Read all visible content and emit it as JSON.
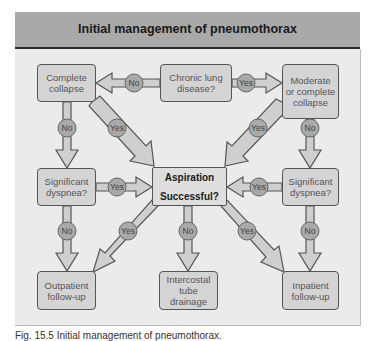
{
  "title": "Initial management of pneumothorax",
  "colors": {
    "title_bar": "#a9a9a9",
    "panel_bg": "#ebebeb",
    "node_fill": "#d4d4d4",
    "arrow_fill": "#cfcfcf",
    "badge_fill": "#aaaaaa",
    "stroke": "#555555"
  },
  "nodes": {
    "chronic_lung_disease": "Chronic lung\ndisease?",
    "complete_collapse": "Complete\ncollapse",
    "moderate_or_complete_collapse": "Moderate\nor complete\ncollapse",
    "significant_dyspnea_left": "Significant\ndyspnea?",
    "significant_dyspnea_right": "Significant\ndyspnea?",
    "aspiration_line1": "Aspiration",
    "aspiration_line2": "Successful?",
    "outpatient_followup": "Outpatient\nfollow-up",
    "intercostal_tube_drainage": "Intercostal\ntube\ndrainage",
    "inpatient_followup": "Inpatient\nfollow-up"
  },
  "edge_labels": {
    "chronic_to_complete": "No",
    "chronic_to_moderate": "Yes",
    "complete_to_dyspnea": "No",
    "complete_to_aspiration": "Yes",
    "moderate_to_aspiration": "Yes",
    "moderate_to_dyspnea": "No",
    "dyspnea_left_to_aspiration": "Yes",
    "dyspnea_right_to_aspiration": "Yes",
    "dyspnea_left_to_outpatient": "No",
    "aspiration_to_outpatient": "Yes",
    "aspiration_to_drainage": "No",
    "aspiration_to_inpatient": "Yes",
    "dyspnea_right_to_inpatient": "No"
  },
  "caption": "Fig. 15.5 Initial management of pneumothorax."
}
